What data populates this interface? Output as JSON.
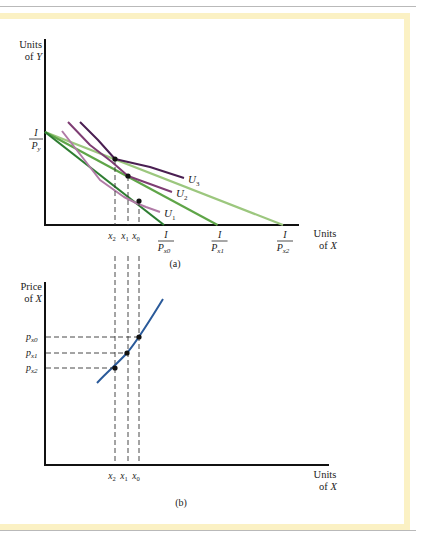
{
  "chart_data": [
    {
      "panel": "(a)",
      "type": "line",
      "title": "",
      "ylabel": [
        "Units",
        "of Y"
      ],
      "xlabel": [
        "Units",
        "of X"
      ],
      "y_intercept_label": {
        "num": "I",
        "den": "P_y"
      },
      "budget_lines": [
        {
          "name": "I/P_x0",
          "num": "I",
          "den_main": "P",
          "den_sub": "x0",
          "color": "#2e7d32",
          "x_intercept": 1.0
        },
        {
          "name": "I/P_x1",
          "num": "I",
          "den_main": "P",
          "den_sub": "x1",
          "color": "#5fa548",
          "x_intercept": 1.45
        },
        {
          "name": "I/P_x2",
          "num": "I",
          "den_main": "P",
          "den_sub": "x2",
          "color": "#9cc77e",
          "x_intercept": 2.0
        }
      ],
      "indifference_curves": [
        {
          "name": "U1",
          "label_main": "U",
          "label_sub": "1",
          "color": "#b07aa6"
        },
        {
          "name": "U2",
          "label_main": "U",
          "label_sub": "2",
          "color": "#7e3d73"
        },
        {
          "name": "U3",
          "label_main": "U",
          "label_sub": "3",
          "color": "#4a1f52"
        }
      ],
      "tangency_points": [
        {
          "label_main": "x",
          "label_sub": "2",
          "x": 0.58
        },
        {
          "label_main": "x",
          "label_sub": "1",
          "x": 0.67
        },
        {
          "label_main": "x",
          "label_sub": "0",
          "x": 0.74
        }
      ],
      "grid": false
    },
    {
      "panel": "(b)",
      "type": "line",
      "title": "",
      "ylabel": [
        "Price",
        "of X"
      ],
      "xlabel": [
        "Units",
        "of X"
      ],
      "series": [
        {
          "name": "price-consumption curve (supply of X-related)",
          "color": "#2a5a9a"
        }
      ],
      "points": [
        {
          "x_label_main": "x",
          "x_label_sub": "2",
          "p_label_main": "P",
          "p_label_sub": "x2"
        },
        {
          "x_label_main": "x",
          "x_label_sub": "1",
          "p_label_main": "P",
          "p_label_sub": "x1"
        },
        {
          "x_label_main": "x",
          "x_label_sub": "0",
          "p_label_main": "P",
          "p_label_sub": "x0"
        }
      ],
      "grid": false
    }
  ],
  "captions": {
    "a": "(a)",
    "b": "(b)"
  }
}
